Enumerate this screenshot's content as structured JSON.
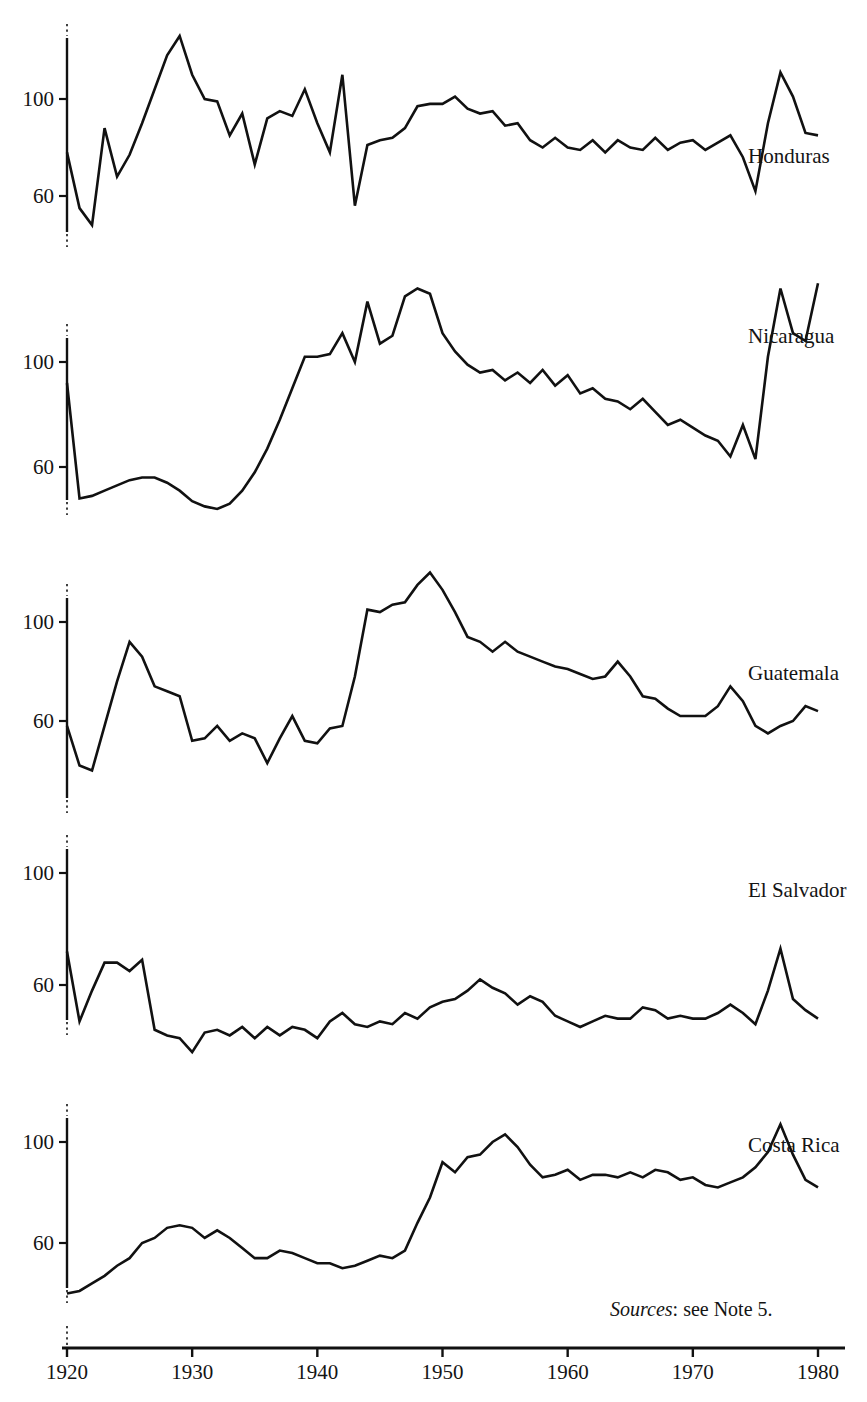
{
  "figure": {
    "source_note_prefix": "Sources",
    "source_note_text": ": see Note 5.",
    "axis_color": "#111111",
    "background": "#ffffff"
  },
  "xaxis": {
    "ticks": [
      1920,
      1930,
      1940,
      1950,
      1960,
      1970,
      1980
    ],
    "labels": [
      "1920",
      "1930",
      "1940",
      "1950",
      "1960",
      "1970",
      "1980"
    ],
    "min": 1920,
    "max": 1980
  },
  "yaxis": {
    "tick_values": [
      60,
      100
    ],
    "tick_labels": [
      "60",
      "100"
    ]
  },
  "panels": [
    {
      "name": "Honduras",
      "label": "Honduras"
    },
    {
      "name": "Nicaragua",
      "label": "Nicaragua"
    },
    {
      "name": "Guatemala",
      "label": "Guatemala"
    },
    {
      "name": "El Salvador",
      "label": "El Salvador"
    },
    {
      "name": "Costa Rica",
      "label": "Costa Rica"
    }
  ],
  "chart_data": {
    "type": "line",
    "title": "",
    "subtitle": "",
    "xlabel": "",
    "ylabel": "",
    "xlim": [
      1920,
      1980
    ],
    "grid": false,
    "legend": "inline-right-of-each-series",
    "panel_layout": "five stacked panels, shared x axis, each with its own y axis labelled 60 and 100",
    "annotations": [
      "Sources: see Note 5."
    ],
    "x": [
      1920,
      1921,
      1922,
      1923,
      1924,
      1925,
      1926,
      1927,
      1928,
      1929,
      1930,
      1931,
      1932,
      1933,
      1934,
      1935,
      1936,
      1937,
      1938,
      1939,
      1940,
      1941,
      1942,
      1943,
      1944,
      1945,
      1946,
      1947,
      1948,
      1949,
      1950,
      1951,
      1952,
      1953,
      1954,
      1955,
      1956,
      1957,
      1958,
      1959,
      1960,
      1961,
      1962,
      1963,
      1964,
      1965,
      1966,
      1967,
      1968,
      1969,
      1970,
      1971,
      1972,
      1973,
      1974,
      1975,
      1976,
      1977,
      1978,
      1979,
      1980
    ],
    "series": [
      {
        "name": "Honduras",
        "ylim": [
          20,
          135
        ],
        "values": [
          78,
          55,
          48,
          88,
          68,
          77,
          90,
          104,
          118,
          126,
          110,
          100,
          99,
          85,
          94,
          73,
          92,
          95,
          93,
          104,
          90,
          78,
          110,
          56,
          81,
          83,
          84,
          88,
          97,
          98,
          98,
          101,
          96,
          94,
          95,
          89,
          90,
          83,
          80,
          84,
          80,
          79,
          83,
          78,
          83,
          80,
          79,
          84,
          79,
          82,
          83,
          79,
          82,
          85,
          76,
          62,
          90,
          111,
          101,
          86,
          85
        ]
      },
      {
        "name": "Nicaragua",
        "ylim": [
          20,
          140
        ],
        "values": [
          92,
          48,
          49,
          51,
          53,
          55,
          56,
          56,
          54,
          51,
          47,
          45,
          44,
          46,
          51,
          58,
          67,
          78,
          90,
          102,
          102,
          103,
          111,
          100,
          123,
          107,
          110,
          125,
          128,
          126,
          111,
          104,
          99,
          96,
          97,
          93,
          96,
          92,
          97,
          91,
          95,
          88,
          90,
          86,
          85,
          82,
          86,
          81,
          76,
          78,
          75,
          72,
          70,
          64,
          76,
          63,
          102,
          128,
          111,
          108,
          130
        ]
      },
      {
        "name": "Guatemala",
        "ylim": [
          18,
          130
        ],
        "values": [
          58,
          42,
          40,
          58,
          76,
          92,
          86,
          74,
          72,
          70,
          52,
          53,
          58,
          52,
          55,
          53,
          43,
          53,
          62,
          52,
          51,
          57,
          58,
          78,
          105,
          104,
          107,
          108,
          115,
          120,
          113,
          104,
          94,
          92,
          88,
          92,
          88,
          86,
          84,
          82,
          81,
          79,
          77,
          78,
          84,
          78,
          70,
          69,
          65,
          62,
          62,
          62,
          66,
          74,
          68,
          58,
          55,
          58,
          60,
          66,
          64
        ]
      },
      {
        "name": "El Salvador",
        "ylim": [
          18,
          122
        ],
        "values": [
          72,
          47,
          58,
          68,
          68,
          65,
          69,
          44,
          42,
          41,
          36,
          43,
          44,
          42,
          45,
          41,
          45,
          42,
          45,
          44,
          41,
          47,
          50,
          46,
          45,
          47,
          46,
          50,
          48,
          52,
          54,
          55,
          58,
          62,
          59,
          57,
          53,
          56,
          54,
          49,
          47,
          45,
          47,
          49,
          48,
          48,
          52,
          51,
          48,
          49,
          48,
          48,
          50,
          53,
          50,
          46,
          58,
          73,
          55,
          51,
          48
        ]
      },
      {
        "name": "Costa Rica",
        "ylim": [
          18,
          120
        ],
        "values": [
          40,
          41,
          44,
          47,
          51,
          54,
          60,
          62,
          66,
          67,
          66,
          62,
          65,
          62,
          58,
          54,
          54,
          57,
          56,
          54,
          52,
          52,
          50,
          51,
          53,
          55,
          54,
          57,
          68,
          78,
          92,
          88,
          94,
          95,
          100,
          103,
          98,
          91,
          86,
          87,
          89,
          85,
          87,
          87,
          86,
          88,
          86,
          89,
          88,
          85,
          86,
          83,
          82,
          84,
          86,
          90,
          96,
          107,
          95,
          85,
          82
        ]
      }
    ]
  }
}
